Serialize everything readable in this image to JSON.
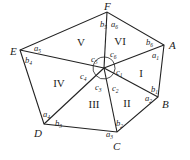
{
  "diagram": {
    "type": "hexagon-triangulation",
    "center": {
      "x": 104,
      "y": 68
    },
    "vertices": [
      {
        "name": "A",
        "x": 164,
        "y": 45,
        "lx": 169,
        "ly": 49
      },
      {
        "name": "B",
        "x": 158,
        "y": 97,
        "lx": 162,
        "ly": 108
      },
      {
        "name": "C",
        "x": 117,
        "y": 132,
        "lx": 113,
        "ly": 150
      },
      {
        "name": "D",
        "x": 44,
        "y": 124,
        "lx": 34,
        "ly": 137
      },
      {
        "name": "E",
        "x": 20,
        "y": 50,
        "lx": 10,
        "ly": 55
      },
      {
        "name": "F",
        "x": 107,
        "y": 12,
        "lx": 104,
        "ly": 10
      }
    ],
    "regions": [
      {
        "label": "I",
        "x": 141,
        "y": 77
      },
      {
        "label": "II",
        "x": 127,
        "y": 107
      },
      {
        "label": "III",
        "x": 94,
        "y": 108
      },
      {
        "label": "IV",
        "x": 59,
        "y": 87
      },
      {
        "label": "V",
        "x": 81,
        "y": 46
      },
      {
        "label": "VI",
        "x": 120,
        "y": 45
      }
    ],
    "angle_labels": [
      {
        "base": "a",
        "sub": "1",
        "x": 152,
        "y": 58
      },
      {
        "base": "b",
        "sub": "1",
        "x": 151,
        "y": 92
      },
      {
        "base": "a",
        "sub": "2",
        "x": 145,
        "y": 101
      },
      {
        "base": "b",
        "sub": "2",
        "x": 116,
        "y": 126
      },
      {
        "base": "a",
        "sub": "3",
        "x": 106,
        "y": 137
      },
      {
        "base": "b",
        "sub": "3",
        "x": 55,
        "y": 126
      },
      {
        "base": "a",
        "sub": "4",
        "x": 43,
        "y": 117
      },
      {
        "base": "b",
        "sub": "4",
        "x": 25,
        "y": 63
      },
      {
        "base": "a",
        "sub": "5",
        "x": 34,
        "y": 51
      },
      {
        "base": "b",
        "sub": "5",
        "x": 100,
        "y": 27
      },
      {
        "base": "a",
        "sub": "6",
        "x": 111,
        "y": 27
      },
      {
        "base": "b",
        "sub": "6",
        "x": 146,
        "y": 45
      },
      {
        "base": "c",
        "sub": "1",
        "x": 116,
        "y": 75
      },
      {
        "base": "c",
        "sub": "2",
        "x": 112,
        "y": 91
      },
      {
        "base": "c",
        "sub": "3",
        "x": 95,
        "y": 90
      },
      {
        "base": "c",
        "sub": "4",
        "x": 80,
        "y": 79
      },
      {
        "base": "c",
        "sub": "5",
        "x": 91,
        "y": 62
      },
      {
        "base": "c",
        "sub": "6",
        "x": 110,
        "y": 57
      }
    ]
  }
}
